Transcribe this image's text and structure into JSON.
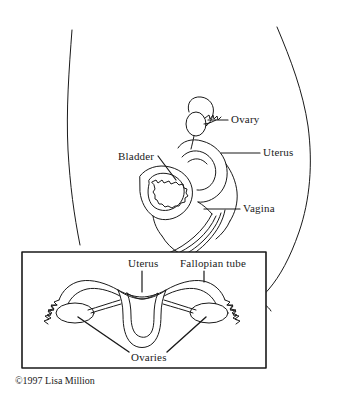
{
  "illustration": {
    "title": "Female reproductive anatomy",
    "line_color": "#1a1a1a",
    "background_color": "#ffffff"
  },
  "sagittal_view": {
    "name": "side view of female pelvis",
    "labels": [
      {
        "id": "ovary",
        "text": "Ovary"
      },
      {
        "id": "uterus",
        "text": "Uterus"
      },
      {
        "id": "vagina",
        "text": "Vagina"
      },
      {
        "id": "bladder",
        "text": "Bladder"
      }
    ]
  },
  "inset_view": {
    "name": "anterior view of uterus, fallopian tubes and ovaries",
    "labels": [
      {
        "id": "uterus",
        "text": "Uterus"
      },
      {
        "id": "fallopiantube",
        "text": "Fallopian tube"
      },
      {
        "id": "ovaries",
        "text": "Ovaries"
      }
    ]
  },
  "credit": {
    "text": "©1997 Lisa Million"
  }
}
